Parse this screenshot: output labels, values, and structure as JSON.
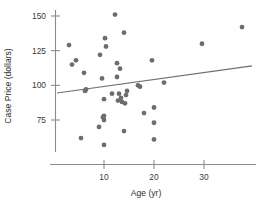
{
  "chart_data": {
    "type": "scatter",
    "title": "",
    "xlabel": "Age (yr)",
    "ylabel": "Case Price (dollars)",
    "xlim": [
      0,
      41
    ],
    "ylim": [
      55,
      157
    ],
    "xticks": [
      10,
      20,
      30
    ],
    "xtick_labels": [
      "10",
      "20",
      "30"
    ],
    "yticks": [
      75,
      100,
      125,
      150
    ],
    "ytick_labels": [
      "75",
      "100",
      "125",
      "150"
    ],
    "grid": false,
    "legend": "none",
    "x": [
      3.0,
      3.6,
      4.4,
      5.4,
      6.0,
      6.2,
      6.4,
      9.0,
      9.2,
      9.6,
      9.8,
      10.0,
      10.0,
      10.0,
      10.0,
      10.2,
      10.4,
      11.6,
      12.2,
      12.6,
      12.6,
      12.8,
      13.0,
      13.2,
      13.4,
      13.6,
      14.0,
      14.0,
      14.2,
      14.4,
      14.6,
      16.8,
      17.2,
      18.0,
      19.6,
      20.0,
      20.0,
      20.0,
      22.0,
      29.6,
      37.6
    ],
    "y": [
      129,
      115,
      118,
      62,
      109,
      96,
      97,
      70,
      122,
      105,
      77,
      75,
      90,
      78,
      57,
      134,
      128,
      94,
      151,
      116,
      106,
      89,
      94,
      112,
      91,
      88,
      138,
      67,
      87,
      93,
      96,
      100,
      99,
      80,
      118,
      73,
      84,
      61,
      102,
      130,
      142
    ],
    "point_color": "#6d6d6d",
    "point_size": 2.4,
    "fit_line": {
      "show": true,
      "color": "#6f6f6f",
      "x_start": 0.6,
      "y_start": 94.5,
      "x_end": 39.6,
      "y_end": 114.0
    }
  },
  "axes": {
    "x_axis_name": "x-axis",
    "y_axis_name": "y-axis"
  }
}
